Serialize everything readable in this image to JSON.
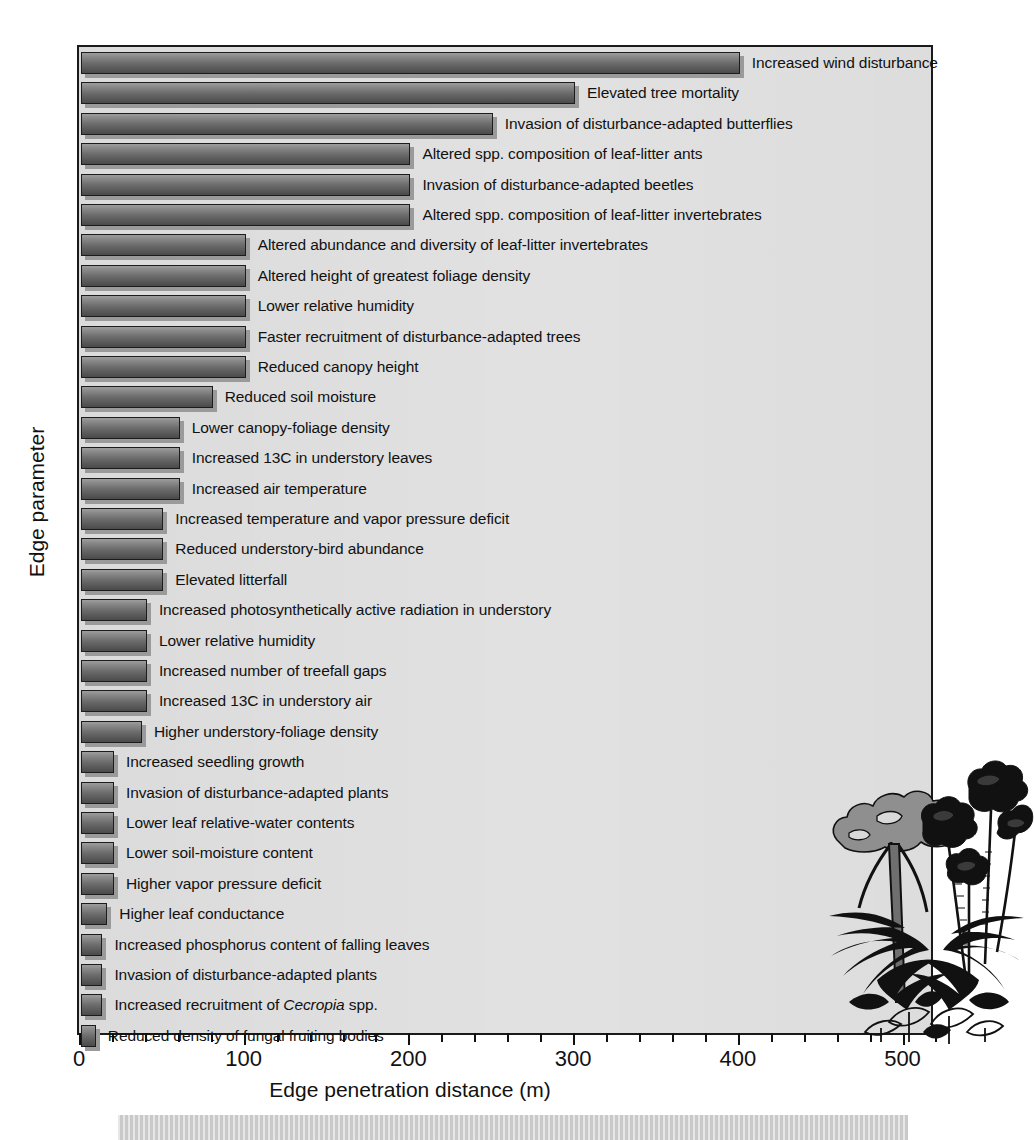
{
  "figure": {
    "background_color": "#ffffff",
    "plot_background_color": "#d9d9d9",
    "bar_color": "#6c6c6c",
    "axis_color": "#1a1a1a"
  },
  "chart_data": {
    "type": "bar",
    "orientation": "horizontal",
    "title": "",
    "xlabel": "Edge penetration distance (m)",
    "ylabel": "Edge parameter",
    "xlim": [
      0,
      520
    ],
    "xticks_major": [
      0,
      100,
      200,
      300,
      400,
      500
    ],
    "xticks_minor_step": 20,
    "grid": false,
    "legend": null,
    "units": "m",
    "categories": [
      "Increased wind disturbance",
      "Elevated tree mortality",
      "Invasion of disturbance-adapted butterflies",
      "Altered spp. composition of leaf-litter ants",
      "Invasion of disturbance-adapted beetles",
      "Altered spp. composition of leaf-litter invertebrates",
      "Altered abundance and diversity of leaf-litter invertebrates",
      "Altered height of greatest foliage density",
      "Lower relative humidity",
      "Faster recruitment of disturbance-adapted trees",
      "Reduced canopy height",
      "Reduced soil moisture",
      "Lower canopy-foliage density",
      "Increased 13C in understory leaves",
      "Increased air temperature",
      "Increased temperature and vapor pressure deficit",
      "Reduced understory-bird abundance",
      "Elevated litterfall",
      "Increased photosynthetically active radiation in understory",
      "Lower relative humidity",
      "Increased number of treefall gaps",
      "Increased 13C in understory air",
      "Higher understory-foliage density",
      "Increased seedling growth",
      "Invasion of disturbance-adapted plants",
      "Lower leaf relative-water contents",
      "Lower soil-moisture content",
      "Higher vapor pressure deficit",
      "Higher leaf conductance",
      "Increased phosphorus content of falling leaves",
      "Invasion of disturbance-adapted plants",
      "Increased recruitment of Cecropia spp.",
      "Reduced density of fungal fruiting bodies"
    ],
    "categories_html": [
      "Increased wind disturbance",
      "Elevated tree mortality",
      "Invasion of disturbance-adapted butterflies",
      "Altered spp. composition of leaf-litter ants",
      "Invasion of disturbance-adapted beetles",
      "Altered spp. composition of leaf-litter invertebrates",
      "Altered abundance and diversity of leaf-litter invertebrates",
      "Altered height of greatest foliage density",
      "Lower relative humidity",
      "Faster recruitment of disturbance-adapted trees",
      "Reduced canopy height",
      "Reduced soil moisture",
      "Lower canopy-foliage density",
      "Increased 13C in understory leaves",
      "Increased air temperature",
      "Increased temperature and vapor pressure deficit",
      "Reduced understory-bird abundance",
      "Elevated litterfall",
      "Increased photosynthetically active radiation in understory",
      "Lower relative humidity",
      "Increased number of treefall gaps",
      "Increased 13C in understory air",
      "Higher understory-foliage density",
      "Increased seedling growth",
      "Invasion of disturbance-adapted plants",
      "Lower leaf relative-water contents",
      "Lower soil-moisture content",
      "Higher vapor pressure deficit",
      "Higher leaf conductance",
      "Increased phosphorus content of falling leaves",
      "Invasion of disturbance-adapted plants",
      "Increased recruitment of <i>Cecropia</i> spp.",
      "Reduced density of fungal fruiting bodies"
    ],
    "values": [
      400,
      300,
      250,
      200,
      200,
      200,
      100,
      100,
      100,
      100,
      100,
      80,
      60,
      60,
      60,
      50,
      50,
      50,
      40,
      40,
      40,
      40,
      37,
      20,
      20,
      20,
      20,
      20,
      16,
      13,
      13,
      13,
      9
    ]
  },
  "illustration": {
    "name": "cecropia-rainforest-plants-illustration",
    "description": "Silhouette line drawing of Cecropia trees with palms and ferns"
  }
}
